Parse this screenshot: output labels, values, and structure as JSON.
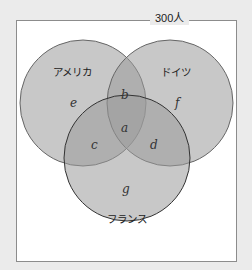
{
  "total_label": "300人",
  "sets": [
    {
      "name": "アメリカ",
      "region": "e"
    },
    {
      "name": "ドイツ",
      "region": "f"
    },
    {
      "name": "フランス",
      "region": "g"
    }
  ],
  "regions": {
    "a": "a",
    "b": "b",
    "c": "c",
    "d": "d",
    "e": "e",
    "f": "f",
    "g": "g"
  },
  "colors": {
    "background": "#ebebeb",
    "frame": "#ffffff",
    "circle_fill": "#9a9a9a",
    "circle_stroke": "#555555"
  }
}
